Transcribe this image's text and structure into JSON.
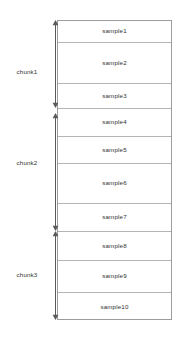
{
  "diagram": {
    "colors": {
      "box_border": "#9c9c9c",
      "row_divider": "#b4b4b4",
      "arrow": "#5a5a5a",
      "text": "#303030",
      "background": "#ffffff"
    },
    "stack": {
      "name": "sample-stack",
      "rows": [
        {
          "label": "sample1",
          "top": 0,
          "height": 22
        },
        {
          "label": "sample2",
          "top": 22,
          "height": 41
        },
        {
          "label": "sample3",
          "top": 63,
          "height": 25
        },
        {
          "label": "sample4",
          "top": 88,
          "height": 28
        },
        {
          "label": "sample5",
          "top": 116,
          "height": 27
        },
        {
          "label": "sample6",
          "top": 143,
          "height": 40
        },
        {
          "label": "sample7",
          "top": 183,
          "height": 28
        },
        {
          "label": "sample8",
          "top": 211,
          "height": 29
        },
        {
          "label": "sample9",
          "top": 240,
          "height": 32
        },
        {
          "label": "sample10",
          "top": 272,
          "height": 28
        }
      ]
    },
    "chunks": [
      {
        "label": "chunk1",
        "arrow_top": 20,
        "arrow_height": 88,
        "label_top": 69,
        "samples": [
          "sample1",
          "sample2",
          "sample3"
        ]
      },
      {
        "label": "chunk2",
        "arrow_top": 113,
        "arrow_height": 118,
        "label_top": 160,
        "samples": [
          "sample4",
          "sample5",
          "sample6",
          "sample7"
        ]
      },
      {
        "label": "chunk3",
        "arrow_top": 231,
        "arrow_height": 89,
        "label_top": 272,
        "samples": [
          "sample8",
          "sample9",
          "sample10"
        ]
      }
    ]
  }
}
